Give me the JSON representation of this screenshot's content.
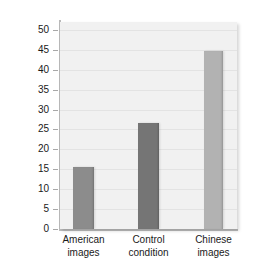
{
  "chart_data": {
    "type": "bar",
    "title": "",
    "subtitle": "",
    "xlabel": "",
    "ylabel": "Percentage of situational attributions",
    "categories": [
      "American images",
      "Control condition",
      "Chinese images"
    ],
    "category_lines": [
      [
        "American",
        "images"
      ],
      [
        "Control",
        "condition"
      ],
      [
        "Chinese",
        "images"
      ]
    ],
    "values": [
      15.5,
      26.7,
      44.8
    ],
    "ylim": [
      0,
      52
    ],
    "yticks": [
      0,
      5,
      10,
      15,
      20,
      25,
      30,
      35,
      40,
      45,
      50
    ],
    "ytick_labels": [
      "0",
      "5",
      "10",
      "15",
      "20",
      "25",
      "30",
      "35",
      "40",
      "45",
      "50"
    ],
    "grid": true,
    "legend": false,
    "legend_position": "none",
    "bar_colors": [
      "#8c8c8c",
      "#757575",
      "#b2b2b2"
    ],
    "plot_background": "#f1f1f1",
    "gridline_color": "#e3e3e3",
    "axis_color": "#bdbdbd",
    "text_color": "#1a1a1a"
  }
}
